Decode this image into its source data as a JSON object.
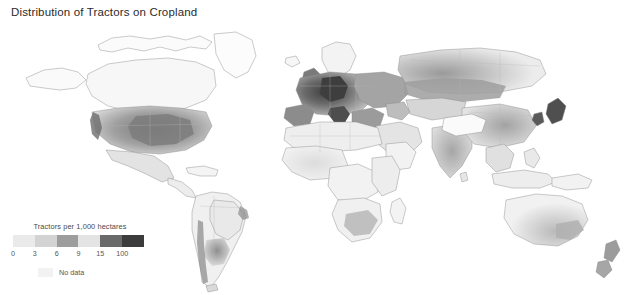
{
  "figure": {
    "title": "Distribution of Tractors on Cropland"
  },
  "legend": {
    "title": "Tractors per 1,000 hectares",
    "ticks": [
      "0",
      "3",
      "6",
      "9",
      "15",
      "100"
    ],
    "colors": [
      "#eaeaea",
      "#d3d3d3",
      "#9d9d9d",
      "#e4e4e4",
      "#6a6a6a",
      "#3c3c3c"
    ],
    "nodata_label": "No data",
    "nodata_color": "#f2f2f2"
  },
  "chart_data": {
    "type": "heatmap",
    "title": "Distribution of Tractors on Cropland",
    "subtitle": "",
    "xlabel": "",
    "ylabel": "",
    "legend_title": "Tractors per 1,000 hectares",
    "legend_position": "bottom-left",
    "grid": false,
    "projection": "world-equirectangular",
    "class_breaks": [
      0,
      3,
      6,
      9,
      15,
      100
    ],
    "class_colors": [
      "#eaeaea",
      "#d3d3d3",
      "#9d9d9d",
      "#e4e4e4",
      "#6a6a6a",
      "#3c3c3c"
    ],
    "nodata_label": "No data",
    "nodata_color": "#f2f2f2",
    "regions": [
      {
        "name": "United States Corn Belt",
        "value": 15,
        "shade": "#8d8d8d"
      },
      {
        "name": "United States Great Plains",
        "value": 9,
        "shade": "#a8a8a8"
      },
      {
        "name": "Canada Prairies",
        "value": 9,
        "shade": "#aeaeae"
      },
      {
        "name": "Mexico",
        "value": 6,
        "shade": "#c8c8c8"
      },
      {
        "name": "Central America",
        "value": 3,
        "shade": "#dcdcdc"
      },
      {
        "name": "Brazil",
        "value": 3,
        "shade": "#dedede"
      },
      {
        "name": "Argentina Pampas",
        "value": 9,
        "shade": "#a9a9a9"
      },
      {
        "name": "Chile",
        "value": 6,
        "shade": "#c0c0c0"
      },
      {
        "name": "Western Europe",
        "value": 100,
        "shade": "#454545"
      },
      {
        "name": "Germany and Benelux",
        "value": 100,
        "shade": "#3c3c3c"
      },
      {
        "name": "Northern Italy",
        "value": 100,
        "shade": "#4a4a4a"
      },
      {
        "name": "Iberian Peninsula",
        "value": 15,
        "shade": "#6f6f6f"
      },
      {
        "name": "Eastern Europe",
        "value": 15,
        "shade": "#8a8a8a"
      },
      {
        "name": "Ukraine and Russia steppe",
        "value": 9,
        "shade": "#a6a6a6"
      },
      {
        "name": "Turkey",
        "value": 15,
        "shade": "#8f8f8f"
      },
      {
        "name": "North Africa",
        "value": 3,
        "shade": "#dcdcdc"
      },
      {
        "name": "Sub-Saharan Africa",
        "value": 0,
        "shade": "#efefef"
      },
      {
        "name": "South Africa",
        "value": 6,
        "shade": "#c4c4c4"
      },
      {
        "name": "Middle East",
        "value": 6,
        "shade": "#cfcfcf"
      },
      {
        "name": "India",
        "value": 9,
        "shade": "#b2b2b2"
      },
      {
        "name": "Eastern China",
        "value": 9,
        "shade": "#b6b6b6"
      },
      {
        "name": "Japan and Korea",
        "value": 100,
        "shade": "#4f4f4f"
      },
      {
        "name": "Southeast Asia",
        "value": 3,
        "shade": "#d9d9d9"
      },
      {
        "name": "Australia southeast",
        "value": 6,
        "shade": "#c6c6c6"
      },
      {
        "name": "New Zealand",
        "value": 15,
        "shade": "#9a9a9a"
      }
    ]
  }
}
